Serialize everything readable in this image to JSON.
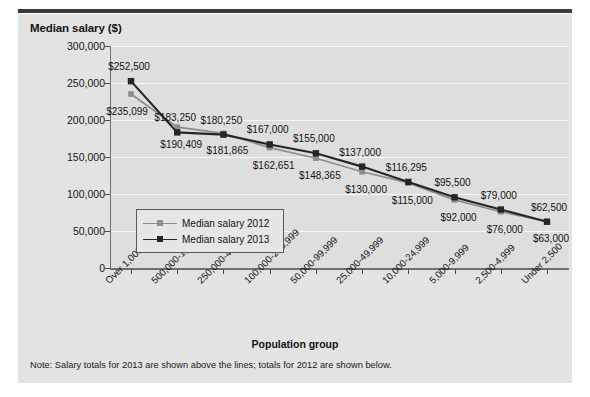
{
  "figure": {
    "title": "Median salary ($)",
    "xaxis_title": "Population group",
    "note": "Note: Salary totals for 2013 are shown above the lines; totals for 2012 are shown below."
  },
  "colors": {
    "card_background": "#e3e3e3",
    "plot_background": "#dedede",
    "gridline": "#f7f7f7",
    "axis": "#6f6f6f",
    "series_2012": "#8d8d8d",
    "series_2013": "#262626",
    "text": "#131313",
    "top_rule": "#3a3a3a"
  },
  "chart_data": {
    "type": "line",
    "title": "Median salary ($)",
    "xlabel": "Population group",
    "ylabel": "Median salary ($)",
    "ylim": [
      0,
      300000
    ],
    "yticks": [
      0,
      50000,
      100000,
      150000,
      200000,
      250000,
      300000
    ],
    "ytick_labels": [
      "0",
      "50,000",
      "100,000",
      "150,000",
      "200,000",
      "250,000",
      "300,000"
    ],
    "grid": true,
    "legend_position": "inside-lower-left",
    "categories": [
      "Over 1,000,000",
      "500,000-1,000,000",
      "250,000-499,999",
      "100,000-249,999",
      "50,000-99,999",
      "25,000-49,999",
      "10,000-24,999",
      "5,000-9,999",
      "2,500-4,999",
      "Under 2,500"
    ],
    "series": [
      {
        "name": "Median salary 2012",
        "color": "#8d8d8d",
        "values": [
          235099,
          190409,
          181865,
          162651,
          148365,
          130000,
          115000,
          92000,
          76000,
          63000
        ],
        "labels": [
          "$235,099",
          "$190,409",
          "$181,865",
          "$162,651",
          "$148,365",
          "$130,000",
          "$115,000",
          "$92,000",
          "$76,000",
          "$63,000"
        ]
      },
      {
        "name": "Median salary 2013",
        "color": "#262626",
        "values": [
          252500,
          183250,
          180250,
          167000,
          155000,
          137000,
          116295,
          95500,
          79000,
          62500
        ],
        "labels": [
          "$252,500",
          "$183,250",
          "$180,250",
          "$167,000",
          "$155,000",
          "$137,000",
          "$116,295",
          "$95,500",
          "$79,000",
          "$62,500"
        ]
      }
    ]
  },
  "legend": {
    "items": [
      {
        "label": "Median salary 2012",
        "color": "#8d8d8d"
      },
      {
        "label": "Median salary 2013",
        "color": "#262626"
      }
    ]
  }
}
